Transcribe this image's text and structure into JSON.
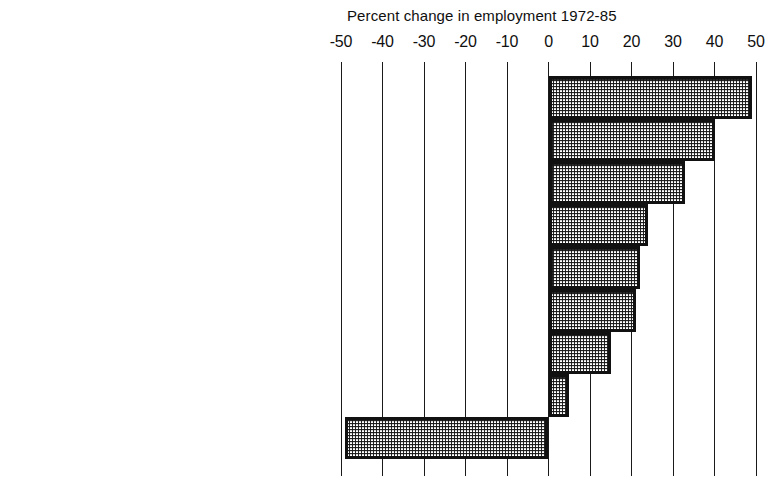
{
  "chart_data": {
    "type": "bar",
    "orientation": "horizontal",
    "title": "Percent change in employment 1972-85",
    "xlabel": "",
    "ylabel": "",
    "xlim": [
      -50,
      50
    ],
    "xticks": [
      -50,
      -40,
      -30,
      -20,
      -10,
      0,
      10,
      20,
      30,
      40,
      50
    ],
    "xtick_labels": [
      "-50",
      "-40",
      "-30",
      "-20",
      "-10",
      "0",
      "10",
      "20",
      "30",
      "40",
      "50"
    ],
    "grid": true,
    "grid_axis": "x",
    "legend": false,
    "categories": [
      "Professional and technical workers",
      "Clerical workers",
      "Managers, officials, and proprietors",
      "Service workers",
      "Salesworkers",
      "Craftworkers",
      "Operatives",
      "Nonfarm laborers",
      "Farm workers"
    ],
    "values": [
      49,
      40,
      33,
      24,
      22,
      21,
      15,
      5,
      -49
    ],
    "bar_fill_color": "#d8d8d8",
    "bar_edge_color": "#111111",
    "bar_pattern": "checkered-halftone"
  },
  "axis": {
    "zero_label": "0"
  }
}
